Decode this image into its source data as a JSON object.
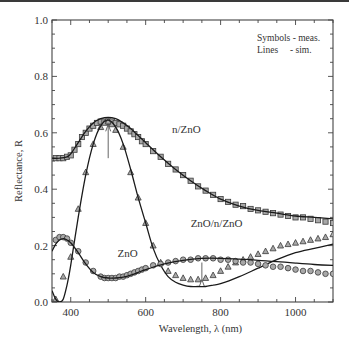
{
  "chart_data": {
    "type": "line",
    "title": "",
    "xlabel": "Wavelength, λ (nm)",
    "ylabel": "Reflectance, R",
    "xlim": [
      350,
      1100
    ],
    "ylim": [
      0.0,
      1.0
    ],
    "xticks": [
      400,
      600,
      800,
      1000
    ],
    "xtick_labels": [
      "400",
      "600",
      "800",
      "1000"
    ],
    "xminor_step": 50,
    "yticks": [
      0.0,
      0.2,
      0.4,
      0.6,
      0.8,
      1.0
    ],
    "ytick_labels": [
      "0.0",
      "0.2",
      "0.4",
      "0.6",
      "0.8",
      "1.0"
    ],
    "yminor_step": 0.05,
    "grid": false,
    "legend_notes": [
      "Symbols - meas.",
      "Lines     - sim."
    ],
    "legend_position": "top-right",
    "series": [
      {
        "name": "n/ZnO",
        "marker": "square",
        "measured": {
          "x": [
            360,
            370,
            380,
            390,
            400,
            410,
            420,
            430,
            440,
            450,
            460,
            470,
            480,
            490,
            500,
            510,
            520,
            530,
            540,
            550,
            560,
            570,
            580,
            590,
            600,
            620,
            640,
            660,
            680,
            700,
            720,
            740,
            760,
            780,
            800,
            820,
            840,
            860,
            880,
            900,
            920,
            940,
            960,
            980,
            1000,
            1020,
            1040,
            1060,
            1080,
            1100
          ],
          "y": [
            0.51,
            0.51,
            0.51,
            0.515,
            0.52,
            0.54,
            0.56,
            0.585,
            0.6,
            0.615,
            0.625,
            0.635,
            0.64,
            0.64,
            0.64,
            0.64,
            0.635,
            0.63,
            0.625,
            0.615,
            0.605,
            0.595,
            0.585,
            0.57,
            0.56,
            0.535,
            0.515,
            0.49,
            0.47,
            0.45,
            0.43,
            0.41,
            0.395,
            0.38,
            0.365,
            0.355,
            0.345,
            0.34,
            0.33,
            0.325,
            0.32,
            0.315,
            0.31,
            0.305,
            0.3,
            0.3,
            0.295,
            0.29,
            0.285,
            0.28
          ]
        },
        "simulated": {
          "x": [
            350,
            370,
            390,
            400,
            420,
            440,
            460,
            480,
            500,
            520,
            540,
            560,
            580,
            600,
            640,
            680,
            720,
            760,
            800,
            850,
            900,
            950,
            1000,
            1050,
            1100
          ],
          "y": [
            0.51,
            0.51,
            0.515,
            0.525,
            0.565,
            0.605,
            0.635,
            0.65,
            0.655,
            0.65,
            0.635,
            0.615,
            0.59,
            0.565,
            0.515,
            0.47,
            0.43,
            0.395,
            0.365,
            0.34,
            0.325,
            0.315,
            0.305,
            0.3,
            0.295
          ]
        }
      },
      {
        "name": "ZnO/n/ZnO",
        "marker": "triangle",
        "measured": {
          "x": [
            360,
            380,
            400,
            420,
            440,
            460,
            480,
            490,
            500,
            510,
            520,
            540,
            560,
            580,
            600,
            620,
            640,
            660,
            680,
            700,
            720,
            740,
            760,
            780,
            800,
            820,
            840,
            860,
            880,
            900,
            920,
            940,
            960,
            980,
            1000,
            1020,
            1040,
            1060,
            1080,
            1100
          ],
          "y": [
            0.01,
            0.09,
            0.16,
            0.33,
            0.46,
            0.56,
            0.62,
            0.635,
            0.64,
            0.63,
            0.61,
            0.55,
            0.46,
            0.37,
            0.28,
            0.2,
            0.14,
            0.11,
            0.095,
            0.085,
            0.08,
            0.08,
            0.085,
            0.095,
            0.11,
            0.125,
            0.14,
            0.15,
            0.16,
            0.17,
            0.18,
            0.19,
            0.2,
            0.205,
            0.21,
            0.215,
            0.22,
            0.225,
            0.23,
            0.24
          ]
        },
        "simulated": {
          "x": [
            350,
            360,
            370,
            380,
            390,
            400,
            420,
            440,
            460,
            480,
            500,
            520,
            540,
            560,
            580,
            600,
            620,
            640,
            660,
            680,
            700,
            720,
            740,
            760,
            780,
            800,
            850,
            900,
            950,
            1000,
            1050,
            1100
          ],
          "y": [
            0.04,
            0.01,
            0.0,
            0.01,
            0.06,
            0.13,
            0.3,
            0.45,
            0.56,
            0.625,
            0.645,
            0.62,
            0.56,
            0.47,
            0.37,
            0.28,
            0.19,
            0.13,
            0.09,
            0.07,
            0.06,
            0.055,
            0.055,
            0.055,
            0.06,
            0.065,
            0.09,
            0.12,
            0.15,
            0.175,
            0.19,
            0.205
          ]
        }
      },
      {
        "name": "ZnO",
        "marker": "circle",
        "measured": {
          "x": [
            360,
            370,
            380,
            390,
            400,
            420,
            440,
            460,
            480,
            490,
            500,
            510,
            520,
            530,
            540,
            550,
            560,
            570,
            580,
            590,
            600,
            620,
            640,
            660,
            680,
            700,
            720,
            740,
            760,
            780,
            800,
            820,
            840,
            860,
            880,
            900,
            920,
            940,
            960,
            980,
            1000,
            1020,
            1040,
            1060,
            1080,
            1100
          ],
          "y": [
            0.22,
            0.23,
            0.23,
            0.225,
            0.21,
            0.18,
            0.14,
            0.11,
            0.09,
            0.085,
            0.085,
            0.085,
            0.085,
            0.09,
            0.09,
            0.095,
            0.1,
            0.105,
            0.11,
            0.115,
            0.12,
            0.13,
            0.135,
            0.14,
            0.145,
            0.15,
            0.15,
            0.155,
            0.155,
            0.155,
            0.15,
            0.15,
            0.145,
            0.14,
            0.14,
            0.135,
            0.13,
            0.125,
            0.125,
            0.12,
            0.115,
            0.11,
            0.11,
            0.105,
            0.1,
            0.1
          ]
        },
        "simulated": {
          "x": [
            350,
            360,
            370,
            380,
            390,
            400,
            420,
            440,
            460,
            480,
            500,
            520,
            540,
            560,
            580,
            600,
            650,
            700,
            750,
            800,
            850,
            900,
            950,
            1000,
            1050,
            1100
          ],
          "y": [
            0.18,
            0.205,
            0.22,
            0.225,
            0.22,
            0.21,
            0.175,
            0.135,
            0.105,
            0.09,
            0.085,
            0.085,
            0.088,
            0.095,
            0.105,
            0.115,
            0.135,
            0.148,
            0.155,
            0.155,
            0.152,
            0.148,
            0.143,
            0.138,
            0.133,
            0.13
          ]
        }
      }
    ],
    "annotations": [
      {
        "text": "n/ZnO",
        "x": 670,
        "y": 0.6
      },
      {
        "text": "ZnO/n/ZnO",
        "x": 720,
        "y": 0.265
      },
      {
        "text": "ZnO",
        "x": 525,
        "y": 0.16
      }
    ],
    "arrows": [
      {
        "x": 500,
        "y_from": 0.51,
        "y_to": 0.63
      },
      {
        "x": 750,
        "y_from": 0.14,
        "y_to": 0.08
      }
    ]
  }
}
